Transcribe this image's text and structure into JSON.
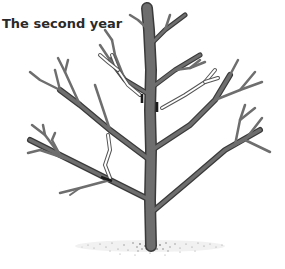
{
  "figure": {
    "title": "The second year",
    "colors": {
      "branch": "#6e6e6e",
      "outline": "#3a3a3a",
      "cut_mark": "#1a1a1a",
      "background": "#ffffff"
    }
  }
}
